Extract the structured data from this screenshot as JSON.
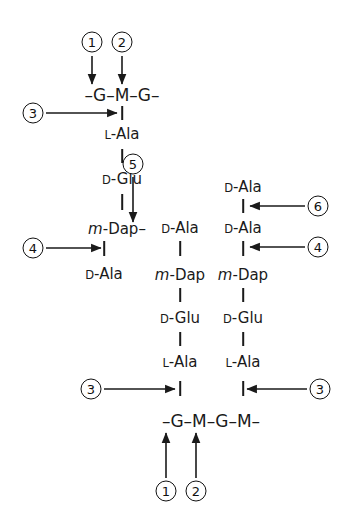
{
  "diagram": {
    "type": "chemical-structure-diagram",
    "ink_color": "#1a1a1a",
    "background": "#ffffff"
  },
  "glycan_chains": [
    {
      "id": "top-glycan",
      "text": "–G–M–G–",
      "units": [
        "G",
        "M",
        "G"
      ]
    },
    {
      "id": "bottom-glycan",
      "text": "–G–M–G–M–",
      "units": [
        "G",
        "M",
        "G",
        "M"
      ]
    }
  ],
  "peptide_stems": [
    {
      "id": "stem-left",
      "attached_to": "top-glycan M",
      "residues": [
        {
          "prefix": "L",
          "name": "Ala",
          "italic_prefix": false
        },
        {
          "prefix": "D",
          "name": "Glu",
          "italic_prefix": false
        },
        {
          "prefix": "m",
          "name": "Dap",
          "italic_prefix": true
        },
        {
          "prefix": "D",
          "name": "Ala",
          "italic_prefix": false
        }
      ]
    },
    {
      "id": "stem-middle",
      "attached_to": "bottom-glycan M (first)",
      "residues": [
        {
          "prefix": "D",
          "name": "Ala",
          "italic_prefix": false
        },
        {
          "prefix": "m",
          "name": "Dap",
          "italic_prefix": true
        },
        {
          "prefix": "D",
          "name": "Glu",
          "italic_prefix": false
        },
        {
          "prefix": "L",
          "name": "Ala",
          "italic_prefix": false
        }
      ]
    },
    {
      "id": "stem-right",
      "attached_to": "bottom-glycan M (second)",
      "residues": [
        {
          "prefix": "D",
          "name": "Ala",
          "italic_prefix": false
        },
        {
          "prefix": "D",
          "name": "Ala",
          "italic_prefix": false
        },
        {
          "prefix": "m",
          "name": "Dap",
          "italic_prefix": true
        },
        {
          "prefix": "D",
          "name": "Glu",
          "italic_prefix": false
        },
        {
          "prefix": "L",
          "name": "Ala",
          "italic_prefix": false
        }
      ]
    }
  ],
  "crosslink": {
    "id": "mdap-dala-crosslink",
    "from": "m-Dap",
    "to": "D-Ala",
    "style": "horizontal-dash"
  },
  "labels": {
    "L_Ala": {
      "prefix": "L",
      "body": "-Ala"
    },
    "D_Glu": {
      "prefix": "D",
      "body": "-Glu"
    },
    "D_Ala": {
      "prefix": "D",
      "body": "-Ala"
    },
    "m_Dap": {
      "prefix": "m",
      "body": "-Dap"
    },
    "m_Dap_link": {
      "prefix": "m",
      "body": "-Dap–"
    }
  },
  "callouts": [
    {
      "id": "callout-1-top",
      "number": "1",
      "direction": "down",
      "target": "top glycan G"
    },
    {
      "id": "callout-2-top",
      "number": "2",
      "direction": "down",
      "target": "top glycan M"
    },
    {
      "id": "callout-3-top",
      "number": "3",
      "direction": "right",
      "target": "bond M to L-Ala (top stem)"
    },
    {
      "id": "callout-5",
      "number": "5",
      "direction": "down",
      "target": "m-Dap to D-Ala crosslink"
    },
    {
      "id": "callout-4-left",
      "number": "4",
      "direction": "right",
      "target": "bond m-Dap to D-Ala (left stem)"
    },
    {
      "id": "callout-6-right",
      "number": "6",
      "direction": "left",
      "target": "bond D-Ala to D-Ala (right stem)"
    },
    {
      "id": "callout-4-right",
      "number": "4",
      "direction": "left",
      "target": "bond D-Ala to m-Dap (right stem)"
    },
    {
      "id": "callout-3-bottom-left",
      "number": "3",
      "direction": "right",
      "target": "bond L-Ala to M (bottom, middle stem)"
    },
    {
      "id": "callout-3-bottom-right",
      "number": "3",
      "direction": "left",
      "target": "bond L-Ala to M (bottom, right stem)"
    },
    {
      "id": "callout-1-bottom",
      "number": "1",
      "direction": "up",
      "target": "bottom glycan G (second)"
    },
    {
      "id": "callout-2-bottom",
      "number": "2",
      "direction": "up",
      "target": "bottom glycan M (second)"
    }
  ]
}
